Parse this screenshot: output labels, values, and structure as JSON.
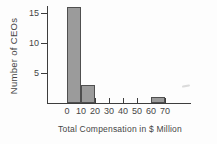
{
  "chart_data": {
    "type": "bar",
    "subtype": "histogram",
    "title": "",
    "xlabel": "Total Compensation in $ Million",
    "ylabel": "Number of CEOs",
    "bins": [
      {
        "start": 0,
        "end": 10,
        "count": 16
      },
      {
        "start": 10,
        "end": 20,
        "count": 3
      },
      {
        "start": 20,
        "end": 30,
        "count": 0
      },
      {
        "start": 30,
        "end": 40,
        "count": 0
      },
      {
        "start": 40,
        "end": 50,
        "count": 0
      },
      {
        "start": 50,
        "end": 60,
        "count": 0
      },
      {
        "start": 60,
        "end": 70,
        "count": 1
      }
    ],
    "x_ticks": [
      0,
      10,
      20,
      30,
      40,
      50,
      60,
      70
    ],
    "y_ticks": [
      5,
      10,
      15
    ],
    "xlim": [
      0,
      88
    ],
    "ylim": [
      0,
      16.5
    ],
    "grid": false,
    "legend": null,
    "colors": {
      "bar_fill": "#9b9b9b",
      "bar_border": "#4f4f4f",
      "axis": "#3d3d3d",
      "text": "#454545"
    }
  }
}
